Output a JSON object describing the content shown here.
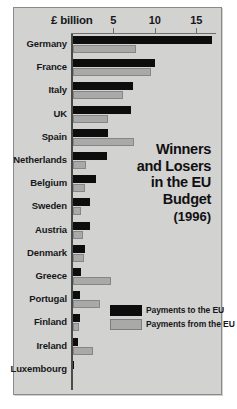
{
  "title": {
    "lines": [
      "Winners",
      "and Losers",
      "in the EU",
      "Budget"
    ],
    "year": "(1996)"
  },
  "axis": {
    "unit_label": "£ billion",
    "ticks": [
      5,
      10,
      15
    ],
    "tick_labels": [
      "5",
      "10",
      "15"
    ],
    "min": 0,
    "max": 17.5
  },
  "legend": {
    "items": [
      {
        "label": "Payments to the EU",
        "color": "#0d0d0d",
        "key": "to"
      },
      {
        "label": "Payments from the EU",
        "color": "#a9a9a7",
        "key": "from"
      }
    ]
  },
  "colors": {
    "background": "#d2d2d0",
    "payments_to": "#0d0d0d",
    "payments_from": "#a9a9a7",
    "axis": "#4b4b4a",
    "text": "#17171a"
  },
  "chart_data": {
    "type": "bar",
    "orientation": "horizontal",
    "xlabel": "£ billion",
    "ylabel": "",
    "xlim": [
      0,
      17.5
    ],
    "grid": false,
    "legend_position": "bottom-right",
    "categories": [
      "Germany",
      "France",
      "Italy",
      "UK",
      "Spain",
      "Netherlands",
      "Belgium",
      "Sweden",
      "Austria",
      "Denmark",
      "Greece",
      "Portugal",
      "Finland",
      "Ireland",
      "Luxembourg"
    ],
    "series": [
      {
        "name": "Payments to the EU",
        "color": "#0d0d0d",
        "values": [
          16.8,
          9.9,
          7.2,
          7.0,
          4.2,
          4.1,
          2.8,
          2.1,
          2.0,
          1.4,
          1.0,
          0.9,
          0.9,
          0.6,
          0.1
        ]
      },
      {
        "name": "Payments from the EU",
        "color": "#a9a9a7",
        "values": [
          7.6,
          9.4,
          6.0,
          4.2,
          7.4,
          1.6,
          1.5,
          1.0,
          1.2,
          1.3,
          4.6,
          3.2,
          0.7,
          2.4,
          0.0
        ]
      }
    ]
  }
}
